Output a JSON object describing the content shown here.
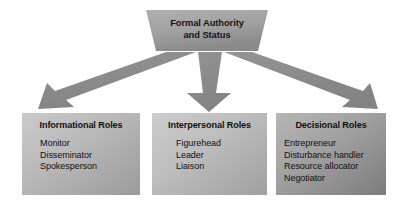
{
  "diagram": {
    "title": "Formal Authority and Status",
    "top_node": {
      "label_line1": "Formal Authority",
      "label_line2": "and Status",
      "shape": "trapezoid",
      "fill_light": "#a7a7a7",
      "fill_dark": "#8e8e8e"
    },
    "connectors": [
      {
        "name": "arrow-to-informational",
        "direction": "down-left",
        "shape": "arrow",
        "fill": "#8b8b8b"
      },
      {
        "name": "arrow-to-interpersonal",
        "direction": "down",
        "shape": "arrow",
        "fill": "#8b8b8b"
      },
      {
        "name": "arrow-to-decisional",
        "direction": "down-right",
        "shape": "arrow",
        "fill": "#8b8b8b"
      }
    ],
    "boxes": [
      {
        "id": "informational",
        "title": "Informational Roles",
        "items": [
          "Monitor",
          "Disseminator",
          "Spokesperson"
        ],
        "fill_light": "#c2c2c2",
        "fill_dark": "#9d9d9d"
      },
      {
        "id": "interpersonal",
        "title": "Interpersonal Roles",
        "items": [
          "Figurehead",
          "Leader",
          "Liaison"
        ],
        "fill_light": "#c6c6c6",
        "fill_dark": "#a2a2a2"
      },
      {
        "id": "decisional",
        "title": "Decisional Roles",
        "items": [
          "Entrepreneur",
          "Disturbance handler",
          "Resource allocator",
          "Negotiator"
        ],
        "fill_light": "#ababab",
        "fill_dark": "#7e7e7e"
      }
    ]
  }
}
